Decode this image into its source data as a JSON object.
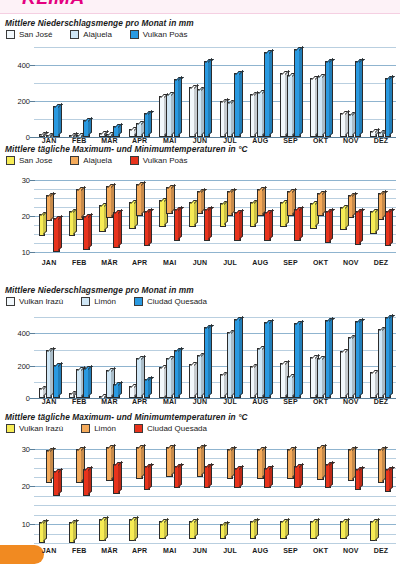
{
  "page": {
    "header_title": "KLIMA",
    "accent_magenta": "#e4007f",
    "accent_orange": "#f18a21"
  },
  "months": [
    "JAN",
    "FEB",
    "MÄR",
    "APR",
    "MAI",
    "JUN",
    "JUL",
    "AUG",
    "SEP",
    "OKT",
    "NOV",
    "DEZ"
  ],
  "colors": {
    "white_blue": "#f2f8fc",
    "light_blue": "#cfe6f5",
    "strong_blue": "#2a9ae1",
    "yellow": "#f7ec55",
    "orange": "#f4aa5a",
    "red": "#e8331c",
    "grid": "#b9cfe0",
    "axis": "#5b7f99"
  },
  "charts": [
    {
      "id": "precip-san-jose",
      "title": "Mittlere Niederschlagsmenge pro Monat in mm",
      "legend": [
        {
          "label": "San José",
          "color": "#f2f8fc"
        },
        {
          "label": "Alajuela",
          "color": "#cfe6f5"
        },
        {
          "label": "Vulkan Poás",
          "color": "#2a9ae1"
        }
      ],
      "chart_data": {
        "type": "bar",
        "title": "Mittlere Niederschlagsmenge pro Monat in mm",
        "xlabel": "",
        "ylabel": "mm",
        "ylim": [
          0,
          500
        ],
        "yticks": [
          0,
          200,
          400
        ],
        "gridstep": 100,
        "grid": true,
        "legend_position": "top-left",
        "categories": [
          "JAN",
          "FEB",
          "MÄR",
          "APR",
          "MAI",
          "JUN",
          "JUL",
          "AUG",
          "SEP",
          "OKT",
          "NOV",
          "DEZ"
        ],
        "series": [
          {
            "name": "San José",
            "values": [
              15,
              5,
              20,
              45,
              230,
              280,
              200,
              240,
              355,
              330,
              135,
              35
            ]
          },
          {
            "name": "Alajuela",
            "values": [
              10,
              10,
              15,
              80,
              240,
              265,
              195,
              250,
              345,
              340,
              130,
              30
            ]
          },
          {
            "name": "Vulkan Poás",
            "values": [
              170,
              95,
              60,
              135,
              320,
              420,
              355,
              470,
              490,
              425,
              420,
              330
            ]
          }
        ]
      }
    },
    {
      "id": "temp-san-jose",
      "title": "Mittlere tägliche Maximum- und Minimumtemperaturen in °C",
      "legend": [
        {
          "label": "San Jose",
          "color": "#f7ec55"
        },
        {
          "label": "Alajuela",
          "color": "#f4aa5a"
        },
        {
          "label": "Vulkan Poás",
          "color": "#e8331c"
        }
      ],
      "chart_data": {
        "type": "bar",
        "subtype": "floating-range",
        "title": "Mittlere tägliche Maximum- und Minimumtemperaturen in °C",
        "ylabel": "°C",
        "ylim": [
          8,
          32
        ],
        "yticks": [
          10,
          20,
          30
        ],
        "gridstep": 2.5,
        "grid": true,
        "legend_position": "top-left",
        "categories": [
          "JAN",
          "FEB",
          "MÄR",
          "APR",
          "MAI",
          "JUN",
          "JUL",
          "AUG",
          "SEP",
          "OKT",
          "NOV",
          "DEZ"
        ],
        "series": [
          {
            "name": "San Jose",
            "min": [
              14.5,
              14.5,
              15.5,
              16.5,
              17,
              17,
              17,
              17,
              17,
              16.5,
              16,
              15
            ],
            "max": [
              20.5,
              21.5,
              23,
              24,
              24.5,
              24,
              23.5,
              24,
              24,
              23.5,
              22.5,
              21.5
            ]
          },
          {
            "name": "Alajuela",
            "min": [
              18.5,
              19,
              19.5,
              20,
              20.5,
              20.5,
              20,
              20,
              20,
              20,
              19.5,
              19
            ],
            "max": [
              26,
              27.5,
              28.5,
              29,
              28,
              27,
              27,
              27.5,
              27,
              26.5,
              26,
              26.5
            ]
          },
          {
            "name": "Vulkan Poás",
            "min": [
              10,
              10.5,
              11,
              11.5,
              13,
              13,
              13,
              13,
              13,
              12.5,
              12,
              11.5
            ],
            "max": [
              19.5,
              20,
              21,
              21.5,
              22,
              22,
              21,
              21,
              22,
              21.5,
              21.5,
              21.5
            ]
          }
        ]
      }
    },
    {
      "id": "precip-irazu",
      "title": "Mittlere Niederschlagsmenge pro Monat in mm",
      "legend": [
        {
          "label": "Vulkan Irazú",
          "color": "#f2f8fc"
        },
        {
          "label": "Limón",
          "color": "#cfe6f5"
        },
        {
          "label": "Ciudad Quesada",
          "color": "#2a9ae1"
        }
      ],
      "chart_data": {
        "type": "bar",
        "title": "Mittlere Niederschlagsmenge pro Monat in mm",
        "ylabel": "mm",
        "ylim": [
          0,
          520
        ],
        "yticks": [
          0,
          200,
          400
        ],
        "gridstep": 100,
        "grid": true,
        "legend_position": "top-left",
        "categories": [
          "JAN",
          "FEB",
          "MÄR",
          "APR",
          "MAI",
          "JUN",
          "JUL",
          "AUG",
          "SEP",
          "OKT",
          "NOV",
          "DEZ"
        ],
        "series": [
          {
            "name": "Vulkan Irazú",
            "values": [
              60,
              30,
              10,
              75,
              195,
              210,
              150,
              200,
              215,
              255,
              290,
              160
            ]
          },
          {
            "name": "Limón",
            "values": [
              300,
              180,
              175,
              250,
              250,
              265,
              410,
              310,
              135,
              245,
              375,
              430
            ]
          },
          {
            "name": "Ciudad Quesada",
            "values": [
              205,
              185,
              85,
              115,
              295,
              440,
              490,
              470,
              465,
              480,
              475,
              500
            ]
          }
        ]
      }
    },
    {
      "id": "temp-irazu",
      "title": "Mittlere tägliche Maximum- und Minimumtemperaturen in °C",
      "legend": [
        {
          "label": "Vulkan Irazú",
          "color": "#f7ec55"
        },
        {
          "label": "Limón",
          "color": "#f4aa5a"
        },
        {
          "label": "Ciudad Quesada",
          "color": "#e8331c"
        }
      ],
      "chart_data": {
        "type": "bar",
        "subtype": "floating-range",
        "title": "Mittlere tägliche Maximum- und Minimumtemperaturen in °C",
        "ylabel": "°C",
        "ylim": [
          4,
          32
        ],
        "yticks": [
          10,
          20,
          30
        ],
        "gridstep": 2.5,
        "grid": true,
        "legend_position": "top-left",
        "categories": [
          "JAN",
          "FEB",
          "MÄR",
          "APR",
          "MAI",
          "JUN",
          "JUL",
          "AUG",
          "SEP",
          "OKT",
          "NOV",
          "DEZ"
        ],
        "series": [
          {
            "name": "Vulkan Irazú",
            "min": [
              5,
              5,
              5.5,
              5.5,
              6,
              6,
              6,
              6,
              6,
              6,
              6,
              5.5
            ],
            "max": [
              10.5,
              10.5,
              11.5,
              11.5,
              11,
              10.8,
              10,
              10.8,
              10.8,
              11,
              11,
              11
            ]
          },
          {
            "name": "Limón",
            "min": [
              21,
              21,
              21.5,
              22,
              22.5,
              22.5,
              22,
              22,
              22,
              21.8,
              21.5,
              21
            ],
            "max": [
              29.5,
              30,
              30.5,
              30.5,
              30.5,
              30.5,
              30,
              30,
              30,
              30.5,
              30,
              30
            ]
          },
          {
            "name": "Ciudad Quesada",
            "min": [
              17.5,
              17.5,
              18,
              19,
              19.5,
              19.5,
              19.5,
              19.5,
              19.5,
              19.5,
              19,
              18.5
            ],
            "max": [
              24,
              24.5,
              26,
              25.5,
              25.5,
              25.5,
              25,
              25,
              25.5,
              26,
              24.5,
              24.5
            ]
          }
        ]
      }
    }
  ]
}
